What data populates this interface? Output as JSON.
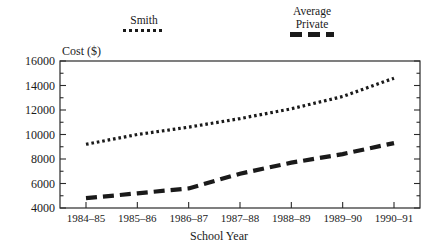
{
  "chart_data": {
    "type": "line",
    "title": "",
    "xlabel": "School Year",
    "ylabel": "Cost ($)",
    "categories": [
      "1984–85",
      "1985–86",
      "1986–87",
      "1987–88",
      "1988–89",
      "1989–90",
      "1990–91"
    ],
    "ylim": [
      4000,
      16000
    ],
    "ytick_step": 2000,
    "yticks": [
      4000,
      6000,
      8000,
      10000,
      12000,
      14000,
      16000
    ],
    "ytick_labels": [
      "4000",
      "6000",
      "8000",
      "10000",
      "12000",
      "14000",
      "16000"
    ],
    "grid": false,
    "legend_position": "above-plot",
    "series": [
      {
        "name": "Smith",
        "linestyle": "dotted",
        "color": "#1a1a1a",
        "values": [
          9200,
          10000,
          10600,
          11300,
          12100,
          13100,
          14600
        ]
      },
      {
        "name": "Average Private",
        "linestyle": "dashed",
        "color": "#1a1a1a",
        "values": [
          4800,
          5200,
          5600,
          6800,
          7700,
          8400,
          9300
        ]
      }
    ]
  },
  "legend": {
    "smith": {
      "label": "Smith",
      "swatch": "dotted-line-swatch"
    },
    "average_private": {
      "label_line1": "Average",
      "label_line2": "Private",
      "swatch": "dashed-line-swatch"
    }
  },
  "axes": {
    "y_title": "Cost ($)",
    "x_title": "School Year"
  },
  "colors": {
    "line": "#1a1a1a",
    "frame": "#2a2a2a",
    "background": "#ffffff"
  }
}
